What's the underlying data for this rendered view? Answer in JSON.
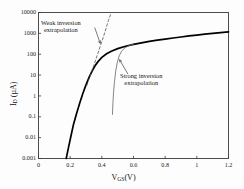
{
  "chart_data": {
    "type": "line",
    "title": "",
    "subtitle": "",
    "xlabel": "V_GS (V)",
    "ylabel": "I_D (uA)",
    "xlabel_main": "V",
    "xlabel_sub": "GS",
    "xlabel_unit": "(V)",
    "ylabel_main": "I",
    "ylabel_sub": "D",
    "ylabel_unit": "(µA)",
    "xscale": "linear",
    "yscale": "log",
    "xlim": [
      0,
      1.2
    ],
    "ylim": [
      0.001,
      10000
    ],
    "grid": false,
    "legend": null,
    "xticks": [
      0,
      0.2,
      0.4,
      0.6,
      0.8,
      1,
      1.2
    ],
    "xtick_labels": [
      "0",
      "0.2",
      "0.4",
      "0.6",
      "0.8",
      "1",
      "1.2"
    ],
    "yticks": [
      0.001,
      0.01,
      0.1,
      1,
      10,
      100,
      1000,
      10000
    ],
    "ytick_labels": [
      "0.001",
      "0.01",
      "0.1",
      "1",
      "10",
      "100",
      "1000",
      "10000"
    ],
    "series": [
      {
        "name": "drain current",
        "style": "solid",
        "color": "#000000",
        "width": 1.7,
        "points": [
          [
            0.175,
            0.001
          ],
          [
            0.19,
            0.0035
          ],
          [
            0.205,
            0.012
          ],
          [
            0.22,
            0.04
          ],
          [
            0.24,
            0.14
          ],
          [
            0.26,
            0.45
          ],
          [
            0.28,
            1.3
          ],
          [
            0.3,
            3.4
          ],
          [
            0.32,
            8.0
          ],
          [
            0.34,
            16.5
          ],
          [
            0.36,
            30
          ],
          [
            0.38,
            48
          ],
          [
            0.4,
            70
          ],
          [
            0.43,
            105
          ],
          [
            0.46,
            140
          ],
          [
            0.5,
            185
          ],
          [
            0.55,
            240
          ],
          [
            0.6,
            295
          ],
          [
            0.65,
            350
          ],
          [
            0.7,
            410
          ],
          [
            0.75,
            470
          ],
          [
            0.8,
            530
          ],
          [
            0.85,
            600
          ],
          [
            0.9,
            670
          ],
          [
            0.95,
            750
          ],
          [
            1.0,
            830
          ],
          [
            1.05,
            910
          ],
          [
            1.1,
            1000
          ],
          [
            1.15,
            1090
          ],
          [
            1.2,
            1180
          ]
        ]
      },
      {
        "name": "weak inversion extrapolation",
        "style": "dashed",
        "color": "#555555",
        "width": 0.8,
        "points": [
          [
            0.305,
            3.2
          ],
          [
            0.34,
            18
          ],
          [
            0.375,
            110
          ],
          [
            0.41,
            680
          ],
          [
            0.442,
            4200
          ],
          [
            0.46,
            11000
          ]
        ]
      },
      {
        "name": "strong inversion extrapolation",
        "style": "solid",
        "color": "#666666",
        "width": 0.8,
        "points": [
          [
            0.6,
            300
          ],
          [
            0.57,
            255
          ],
          [
            0.545,
            200
          ],
          [
            0.525,
            140
          ],
          [
            0.51,
            85
          ],
          [
            0.498,
            42
          ],
          [
            0.488,
            16
          ],
          [
            0.48,
            5.0
          ],
          [
            0.474,
            1.5
          ],
          [
            0.47,
            0.45
          ],
          [
            0.467,
            0.13
          ]
        ]
      }
    ],
    "annotations": [
      {
        "id": "weak-inversion-annotation",
        "line1": "Weak inversion",
        "line2": "extrapolation",
        "leader_from": [
          0.355,
          1900
        ],
        "leader_to": [
          0.39,
          330
        ]
      },
      {
        "id": "strong-inversion-annotation",
        "line1": "Strong inversion",
        "line2": "extrapolation",
        "leader_from": [
          0.565,
          11
        ],
        "leader_to": [
          0.512,
          55
        ]
      }
    ]
  },
  "frame": {
    "color": "#3a3a3a",
    "width": 0.9
  }
}
